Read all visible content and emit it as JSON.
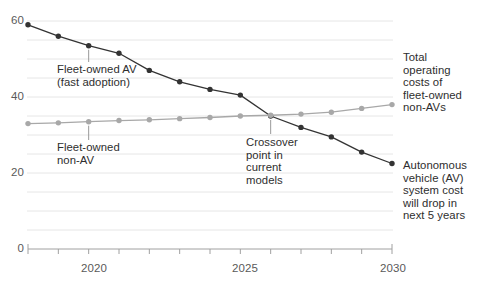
{
  "chart_data": {
    "type": "line",
    "title": "",
    "subtitle": "",
    "xlabel": "",
    "ylabel": "",
    "x": [
      2018,
      2019,
      2020,
      2021,
      2022,
      2023,
      2024,
      2025,
      2026,
      2027,
      2028,
      2029,
      2030
    ],
    "xlim": [
      2018,
      2030
    ],
    "ylim": [
      0,
      62
    ],
    "y_ticks": [
      0,
      20,
      40,
      60
    ],
    "y_tick_labels": [
      "0",
      "20",
      "40",
      "60"
    ],
    "x_ticks": [
      2018,
      2019,
      2020,
      2021,
      2022,
      2023,
      2024,
      2025,
      2026,
      2027,
      2028,
      2029,
      2030
    ],
    "x_tick_labels": [
      "",
      "",
      "2020",
      "",
      "",
      "",
      "",
      "2025",
      "",
      "",
      "",
      "",
      "2030"
    ],
    "grid": "horizontal-every-5-units",
    "gridlines": [
      5,
      10,
      15,
      20,
      25,
      30,
      35,
      40,
      45,
      50,
      55,
      60
    ],
    "legend": "annotations-inline",
    "series": [
      {
        "name": "Fleet-owned AV (fast adoption)",
        "color": "#333333",
        "marker": "circle",
        "values": [
          59,
          56,
          53.5,
          51.5,
          47,
          44,
          42,
          40.5,
          35,
          32,
          29.5,
          25.5,
          22.5
        ]
      },
      {
        "name": "Fleet-owned non-AV",
        "color": "#a8a8a8",
        "marker": "circle",
        "values": [
          33,
          33.2,
          33.5,
          33.8,
          34,
          34.3,
          34.6,
          35,
          35.2,
          35.5,
          36,
          37,
          38
        ]
      }
    ],
    "annotations": [
      {
        "id": "fleet-owned-av",
        "text": "Fleet-owned AV\n(fast adoption)",
        "leader_to_x": 2020,
        "leader_to_y": 53.5
      },
      {
        "id": "fleet-owned-non-av",
        "text": "Fleet-owned\nnon-AV",
        "leader_to_x": 2020,
        "leader_to_y": 33.5
      },
      {
        "id": "crossover-point",
        "text": "Crossover\npoint in\ncurrent\nmodels",
        "leader_to_x": 2026,
        "leader_to_y": 35
      },
      {
        "id": "total-operating-costs",
        "text": "Total\noperating\ncosts of\nfleet-owned\nnon-AVs"
      },
      {
        "id": "av-system-cost",
        "text": "Autonomous\nvehicle (AV)\nsystem cost\nwill drop in\nnext 5 years"
      }
    ]
  },
  "colors": {
    "av_line": "#333333",
    "non_av_line": "#a8a8a8",
    "gridline": "#e6e6e6",
    "axis": "#a0a0a0",
    "text": "#2e2e2e",
    "tick_text": "#5a5a5a",
    "background": "#ffffff"
  },
  "axis": {
    "y_labels": [
      "60",
      "40",
      "20",
      "0"
    ],
    "x_labels": [
      "2020",
      "2025",
      "2030"
    ]
  }
}
